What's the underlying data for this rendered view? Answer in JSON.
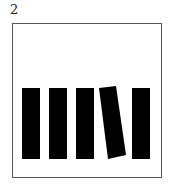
{
  "figure": {
    "label": "2",
    "bar_color": "#000000",
    "frame_color": "#555555",
    "bars": [
      {
        "id": 1,
        "tilted": false
      },
      {
        "id": 2,
        "tilted": false
      },
      {
        "id": 3,
        "tilted": false
      },
      {
        "id": 4,
        "tilted": true
      },
      {
        "id": 5,
        "tilted": false
      }
    ]
  }
}
